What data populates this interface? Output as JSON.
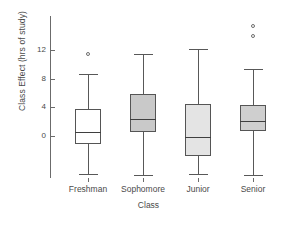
{
  "chart_data": {
    "type": "box",
    "title": "",
    "xlabel": "Class",
    "ylabel": "Class Effect (hrs of study)",
    "grid": false,
    "legend": "none",
    "categories": [
      "Freshman",
      "Sophomore",
      "Junior",
      "Senior"
    ],
    "ylim": [
      -6.5,
      16.5
    ],
    "yticks": [
      0,
      4,
      8,
      12
    ],
    "ytick_labels": [
      "0",
      "4",
      "8",
      "12"
    ],
    "boxes": [
      {
        "category": "Freshman",
        "whisker_low": -5.3,
        "q1": -1.1,
        "median": 0.6,
        "q3": 3.8,
        "whisker_high": 8.6,
        "outliers": [
          11.4
        ],
        "fill": "#ffffff"
      },
      {
        "category": "Sophomore",
        "whisker_low": -5.4,
        "q1": 0.5,
        "median": 2.4,
        "q3": 5.8,
        "whisker_high": 11.4,
        "outliers": [],
        "fill": "#c9c9c9"
      },
      {
        "category": "Junior",
        "whisker_low": -5.3,
        "q1": -2.8,
        "median": -0.2,
        "q3": 4.5,
        "whisker_high": 12.1,
        "outliers": [],
        "fill": "#e4e4e4"
      },
      {
        "category": "Senior",
        "whisker_low": -5.5,
        "q1": 0.7,
        "median": 2.1,
        "q3": 4.3,
        "whisker_high": 9.4,
        "outliers": [
          15.4,
          14.0
        ],
        "fill": "#cfcfcf"
      }
    ]
  },
  "axes": {
    "ylabel": "Class Effect (hrs of study)",
    "xlabel": "Class"
  },
  "colors": {
    "axis": "#6b6b6b",
    "box_stroke": "#555555",
    "median": "#3f3f3f",
    "whisker": "#585858",
    "outlier_stroke": "#6e6e6e",
    "text": "#4a4a4a",
    "background": "#ffffff"
  }
}
